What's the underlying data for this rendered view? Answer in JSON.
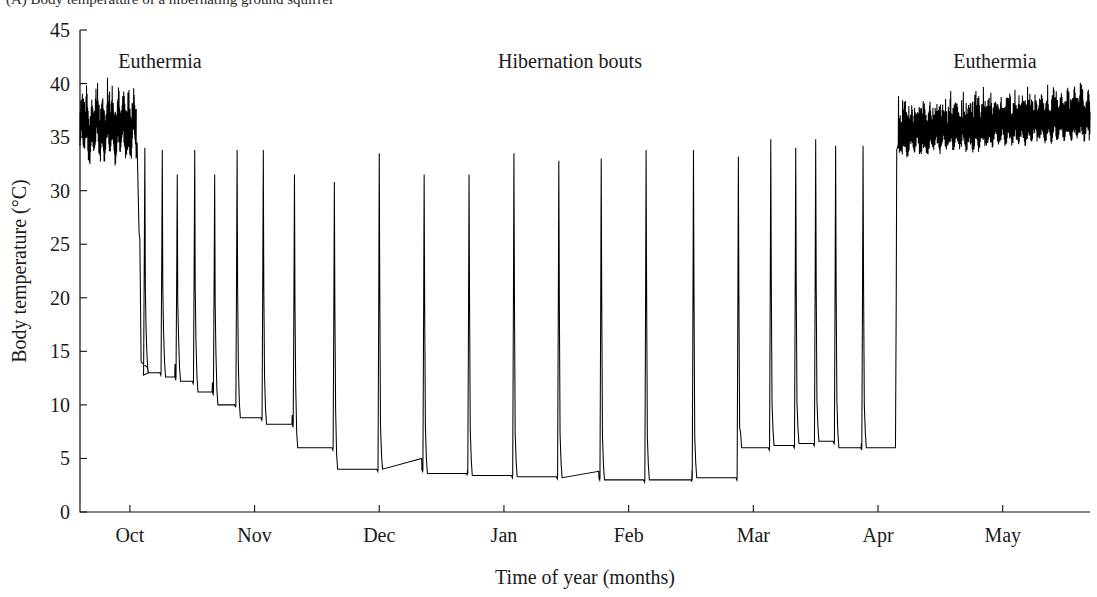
{
  "caption": {
    "partial_top_text": "(A) Body temperature of a hibernating ground squirrel"
  },
  "annotations": [
    {
      "name": "euthermia-left",
      "text": "Euthermia",
      "x": 160,
      "y": 68
    },
    {
      "name": "hibernation-bouts",
      "text": "Hibernation bouts",
      "x": 570,
      "y": 68
    },
    {
      "name": "euthermia-right",
      "text": "Euthermia",
      "x": 995,
      "y": 68
    }
  ],
  "chart_data": {
    "type": "line",
    "title": "",
    "xlabel": "Time of year (months)",
    "ylabel": "Body temperature (°C)",
    "ylim": [
      0,
      45
    ],
    "ytick_step": 5,
    "yticks": [
      0,
      5,
      10,
      15,
      20,
      25,
      30,
      35,
      40,
      45
    ],
    "ytick_labels": [
      "0",
      "5",
      "10",
      "15",
      "20",
      "25",
      "30",
      "35",
      "40",
      "45"
    ],
    "xlim": [
      0,
      8.1
    ],
    "xticks": [
      0.4,
      1.4,
      2.4,
      3.4,
      4.4,
      5.4,
      6.4,
      7.4
    ],
    "xtick_labels": [
      "Oct",
      "Nov",
      "Dec",
      "Jan",
      "Feb",
      "Mar",
      "Apr",
      "May"
    ],
    "x_unit": "months since mid-September",
    "grid": false,
    "legend": false,
    "line_color": "#000000",
    "series_name": "body temperature",
    "phases": [
      {
        "name": "euthermia-autumn",
        "x_start": 0.0,
        "x_end": 0.45,
        "mean_c": 35.5,
        "min_c": 32.8,
        "max_c": 40.0,
        "description": "rapid daily oscillation before hibernation"
      },
      {
        "name": "hibernation",
        "x_start": 0.45,
        "x_end": 6.48,
        "torpor_min_c": 3.0,
        "torpor_max_c": 11.5,
        "arousal_peak_c": 34.0,
        "description": "multiday torpor bouts separated by brief periodic arousals"
      },
      {
        "name": "euthermia-spring",
        "x_start": 6.55,
        "x_end": 8.1,
        "mean_c": 36.3,
        "min_c": 33.5,
        "max_c": 39.5,
        "description": "return to stable high body temperature"
      }
    ],
    "torpor_bouts": [
      {
        "index": 1,
        "arousal_x": 0.52,
        "peak_c": 34.0,
        "plateau_c": 13.0,
        "bout_end_x": 0.64
      },
      {
        "index": 2,
        "arousal_x": 0.66,
        "peak_c": 33.8,
        "plateau_c": 12.6,
        "bout_end_x": 0.76
      },
      {
        "index": 3,
        "arousal_x": 0.78,
        "peak_c": 31.5,
        "plateau_c": 12.2,
        "bout_end_x": 0.9
      },
      {
        "index": 4,
        "arousal_x": 0.92,
        "peak_c": 33.8,
        "plateau_c": 11.2,
        "bout_end_x": 1.06
      },
      {
        "index": 5,
        "arousal_x": 1.08,
        "peak_c": 31.5,
        "plateau_c": 10.0,
        "bout_end_x": 1.24
      },
      {
        "index": 6,
        "arousal_x": 1.26,
        "peak_c": 33.8,
        "plateau_c": 8.8,
        "bout_end_x": 1.45
      },
      {
        "index": 7,
        "arousal_x": 1.47,
        "peak_c": 33.8,
        "plateau_c": 8.2,
        "bout_end_x": 1.7
      },
      {
        "index": 8,
        "arousal_x": 1.72,
        "peak_c": 31.5,
        "plateau_c": 6.0,
        "bout_end_x": 2.02
      },
      {
        "index": 9,
        "arousal_x": 2.04,
        "peak_c": 30.8,
        "plateau_c": 4.0,
        "bout_end_x": 2.38
      },
      {
        "index": 10,
        "arousal_x": 2.4,
        "peak_c": 33.5,
        "plateau_c": 4.0,
        "bout_end_x": 2.74
      },
      {
        "index": 11,
        "arousal_x": 2.76,
        "peak_c": 31.5,
        "plateau_c": 3.6,
        "bout_end_x": 3.1
      },
      {
        "index": 12,
        "arousal_x": 3.12,
        "peak_c": 31.5,
        "plateau_c": 3.4,
        "bout_end_x": 3.46
      },
      {
        "index": 13,
        "arousal_x": 3.48,
        "peak_c": 33.5,
        "plateau_c": 3.3,
        "bout_end_x": 3.82
      },
      {
        "index": 14,
        "arousal_x": 3.84,
        "peak_c": 32.8,
        "plateau_c": 3.2,
        "bout_end_x": 4.16
      },
      {
        "index": 15,
        "arousal_x": 4.18,
        "peak_c": 33.0,
        "plateau_c": 3.0,
        "bout_end_x": 4.52
      },
      {
        "index": 16,
        "arousal_x": 4.54,
        "peak_c": 33.8,
        "plateau_c": 3.0,
        "bout_end_x": 4.9
      },
      {
        "index": 17,
        "arousal_x": 4.92,
        "peak_c": 33.8,
        "plateau_c": 3.2,
        "bout_end_x": 5.26
      },
      {
        "index": 18,
        "arousal_x": 5.28,
        "peak_c": 33.2,
        "plateau_c": 6.0,
        "bout_end_x": 5.52
      },
      {
        "index": 19,
        "arousal_x": 5.54,
        "peak_c": 34.8,
        "plateau_c": 6.2,
        "bout_end_x": 5.72
      },
      {
        "index": 20,
        "arousal_x": 5.74,
        "peak_c": 34.0,
        "plateau_c": 6.4,
        "bout_end_x": 5.88
      },
      {
        "index": 21,
        "arousal_x": 5.9,
        "peak_c": 34.8,
        "plateau_c": 6.6,
        "bout_end_x": 6.04
      },
      {
        "index": 22,
        "arousal_x": 6.06,
        "peak_c": 34.2,
        "plateau_c": 6.0,
        "bout_end_x": 6.26
      },
      {
        "index": 23,
        "arousal_x": 6.28,
        "peak_c": 34.2,
        "plateau_c": 6.0,
        "bout_end_x": 6.5
      }
    ]
  },
  "geometry": {
    "plot_left": 80,
    "plot_right": 1090,
    "plot_top": 30,
    "plot_bottom": 512,
    "tick_len": 7,
    "month_width_px": 128
  }
}
